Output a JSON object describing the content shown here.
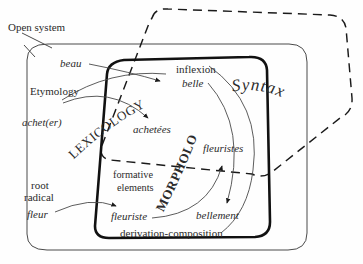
{
  "diagram": {
    "colors": {
      "ink": "#2b2b2b",
      "thin_stroke": "#4a4a4a",
      "thick_stroke": "#111111",
      "dashed_stroke": "#1a1a1a",
      "background": "#fefefe"
    },
    "outer_label": "Open system",
    "domains": {
      "lexicology": "LEXICOLOGY",
      "morphology": "MORPHOLOGY",
      "syntax": "Syntax"
    },
    "left_labels": {
      "etymology": "Etymology",
      "root_line1": "root",
      "root_line2": "radical"
    },
    "inner_labels": {
      "inflexion": "inflexion",
      "formative_line1": "formative",
      "formative_line2": "elements",
      "derivation": "derivation-composition"
    },
    "words": {
      "beau": "beau",
      "acheter": "achet(er)",
      "fleur": "fleur",
      "belle": "belle",
      "achetees": "achetées",
      "fleuristes": "fleuristes",
      "fleuriste": "fleuriste",
      "bellement": "bellement"
    },
    "arrows": [
      {
        "from": "beau",
        "to": "belle"
      },
      {
        "from": "achet(er)",
        "to": "achetées"
      },
      {
        "from": "fleur",
        "to": "fleuriste"
      },
      {
        "from": "fleuriste",
        "to": "fleuristes"
      },
      {
        "from": "belle",
        "to": "bellement"
      }
    ]
  }
}
